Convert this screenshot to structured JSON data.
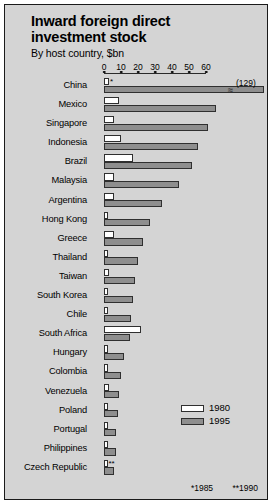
{
  "chart_data": {
    "type": "bar",
    "title": "Inward foreign direct investment stock",
    "subtitle": "By host country, $bn",
    "xlabel": "",
    "ylabel": "",
    "orientation": "horizontal",
    "xlim": [
      0,
      60
    ],
    "ticks": [
      0,
      10,
      20,
      30,
      40,
      50,
      60
    ],
    "grid": false,
    "legend_position": "inside-right",
    "legend": [
      "1980",
      "1995"
    ],
    "series": [
      {
        "name": "1980",
        "color": "#ffffff"
      },
      {
        "name": "1995",
        "color": "#8e8e8e"
      }
    ],
    "categories": [
      "China",
      "Mexico",
      "Singapore",
      "Indonesia",
      "Brazil",
      "Malaysia",
      "Argentina",
      "Hong Kong",
      "Greece",
      "Thailand",
      "Taiwan",
      "South Korea",
      "Chile",
      "South Africa",
      "Hungary",
      "Colombia",
      "Venezuela",
      "Poland",
      "Portugal",
      "Philippines",
      "Czech Republic"
    ],
    "rows": [
      {
        "label": "China",
        "v1980": 3,
        "v1995": 129,
        "truncated": true,
        "value_label": "(129)",
        "note": "*"
      },
      {
        "label": "Mexico",
        "v1980": 9,
        "v1995": 66
      },
      {
        "label": "Singapore",
        "v1980": 6,
        "v1995": 61
      },
      {
        "label": "Indonesia",
        "v1980": 10,
        "v1995": 55
      },
      {
        "label": "Brazil",
        "v1980": 17,
        "v1995": 52
      },
      {
        "label": "Malaysia",
        "v1980": 6,
        "v1995": 44
      },
      {
        "label": "Argentina",
        "v1980": 6,
        "v1995": 34
      },
      {
        "label": "Hong Kong",
        "v1980": 2,
        "v1995": 27
      },
      {
        "label": "Greece",
        "v1980": 6,
        "v1995": 23
      },
      {
        "label": "Thailand",
        "v1980": 1,
        "v1995": 20
      },
      {
        "label": "Taiwan",
        "v1980": 3,
        "v1995": 18
      },
      {
        "label": "South Korea",
        "v1980": 1,
        "v1995": 17
      },
      {
        "label": "Chile",
        "v1980": 1,
        "v1995": 16
      },
      {
        "label": "South Africa",
        "v1980": 22,
        "v1995": 15
      },
      {
        "label": "Hungary",
        "v1980": 1,
        "v1995": 12
      },
      {
        "label": "Colombia",
        "v1980": 2,
        "v1995": 10
      },
      {
        "label": "Venezuela",
        "v1980": 3,
        "v1995": 9
      },
      {
        "label": "Poland",
        "v1980": 1,
        "v1995": 8
      },
      {
        "label": "Portugal",
        "v1980": 1,
        "v1995": 7
      },
      {
        "label": "Philippines",
        "v1980": 1,
        "v1995": 7
      },
      {
        "label": "Czech Republic",
        "v1980": 1,
        "v1995": 6,
        "note": "**"
      }
    ],
    "footnotes": [
      "*1985",
      "**1990"
    ],
    "colors": {
      "bar_1980": "#ffffff",
      "bar_1995": "#8e8e8e",
      "background": "#d4d4d4",
      "outline": "#2f2f2f"
    }
  }
}
